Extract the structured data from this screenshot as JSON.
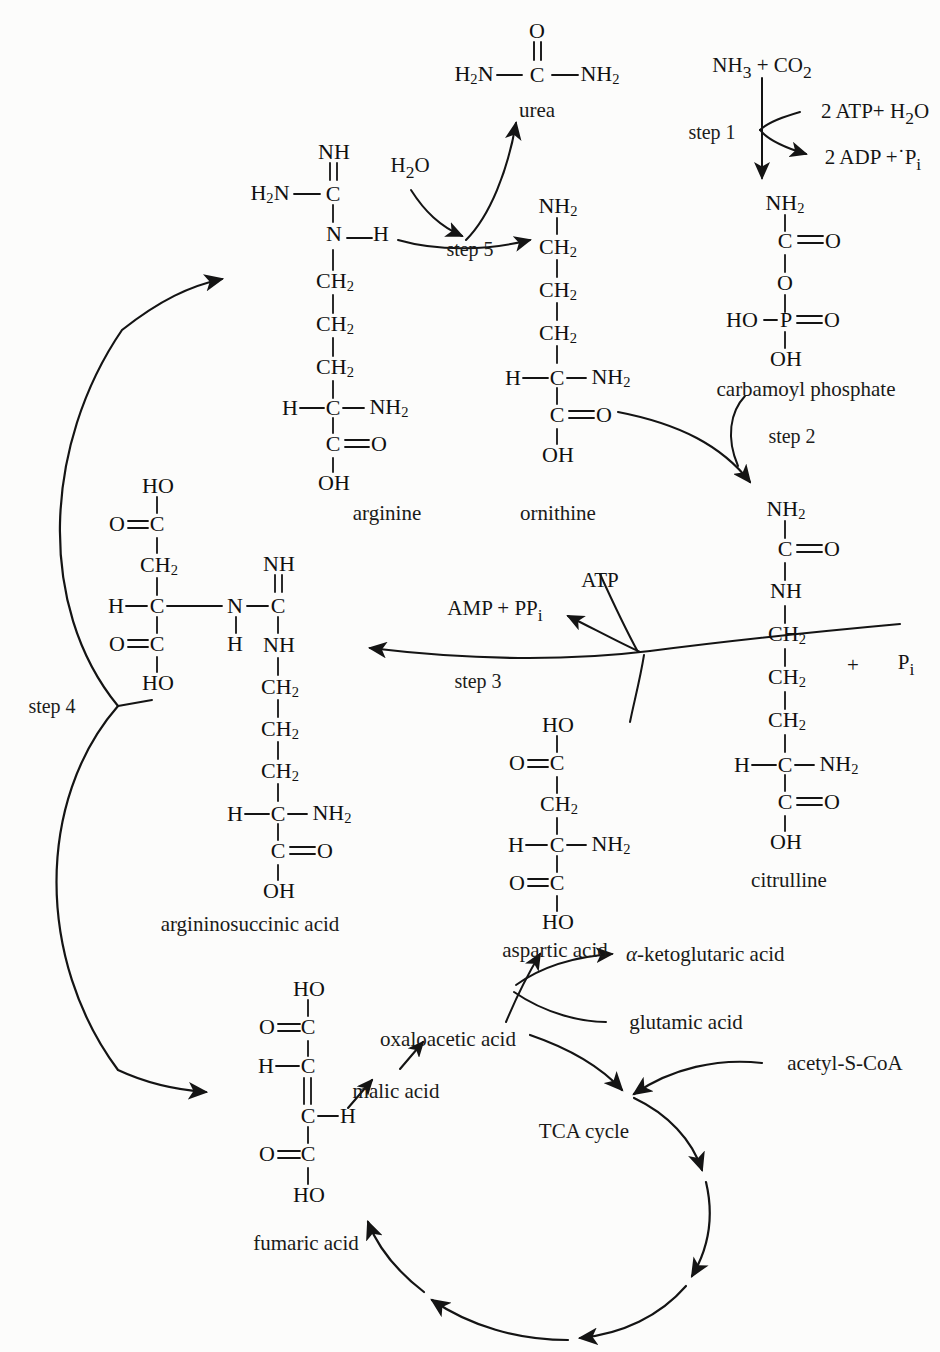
{
  "diagram": {
    "ink_color": "#141414",
    "background_color": "#fcfcfb"
  },
  "molecules": {
    "urea": {
      "name": "urea",
      "atoms": [
        "O",
        "H",
        "N",
        "C",
        "N",
        "H"
      ],
      "left_group": "H",
      "left_sub": "2",
      "left_tail": "N",
      "center": "C",
      "top": "O",
      "right_group": "NH",
      "right_sub": "2"
    },
    "carbamoyl_phosphate": {
      "name": "carbamoyl phosphate",
      "chain": [
        "NH2",
        "C=O",
        "O",
        "HO—P=O",
        "OH"
      ]
    },
    "arginine": {
      "name": "arginine",
      "chain": [
        "NH",
        "H2N—C",
        "N—H",
        "CH2",
        "CH2",
        "CH2",
        "H—C—NH2",
        "C=O",
        "OH"
      ]
    },
    "ornithine": {
      "name": "ornithine",
      "chain": [
        "NH2",
        "CH2",
        "CH2",
        "CH2",
        "H—C—NH2",
        "C=O",
        "OH"
      ]
    },
    "citrulline": {
      "name": "citrulline",
      "chain": [
        "NH2",
        "C=O",
        "NH",
        "CH2",
        "CH2",
        "CH2",
        "H—C—NH2",
        "C=O",
        "OH"
      ]
    },
    "argininosuccinic_acid": {
      "name": "argininosuccinic acid",
      "chain": [
        "HO",
        "O=C",
        "CH2",
        "H—C—N",
        "O=C",
        "HO",
        "H",
        "NH",
        "C",
        "NH",
        "CH2",
        "CH2",
        "CH2",
        "H—C—NH2",
        "C=O",
        "OH"
      ]
    },
    "aspartic_acid": {
      "name": "aspartic acid",
      "chain": [
        "HO",
        "O=C",
        "CH2",
        "H—C—NH2",
        "O=C",
        "HO"
      ]
    },
    "fumaric_acid": {
      "name": "fumaric acid",
      "chain": [
        "HO",
        "O=C",
        "H—C",
        "C—H",
        "O=C",
        "HO"
      ]
    }
  },
  "atom_labels": {
    "urea_H2N": "H",
    "urea_H2N_sub": "2",
    "urea_N": "N",
    "urea_C": "C",
    "urea_O": "O",
    "urea_NH2": "NH",
    "urea_NH2_sub": "2",
    "NH2": "NH",
    "NH": "NH",
    "CH2": "CH",
    "C": "C",
    "N": "N",
    "H": "H",
    "O": "O",
    "OH": "OH",
    "HO": "HO",
    "P": "P"
  },
  "steps": {
    "step1": "step 1",
    "step2": "step 2",
    "step3": "step 3",
    "step4": "step 4",
    "step5": "step 5"
  },
  "cofactors": {
    "substrate_top_right": "NH₃ + CO₂",
    "nh3": "NH",
    "nh3_sub": "3",
    "plus": "+",
    "co2": "CO",
    "co2_sub": "2",
    "atp_in_step1": "2 ATP+ H",
    "atp_in_step1_sub": "2",
    "atp_in_step1_tail": "O",
    "adp_out_step1": "2 ADP +˙P",
    "adp_out_step1_sub": "i",
    "water_step5": "H",
    "water_step5_sub": "2",
    "water_step5_tail": "O",
    "atp_step3": "ATP",
    "amp_pp_step3": "AMP + PP",
    "amp_pp_step3_sub": "i",
    "plus_pi": "+",
    "pi": "P",
    "pi_sub": "i"
  },
  "compound_names": {
    "urea": "urea",
    "carbamoyl_phosphate": "carbamoyl phosphate",
    "arginine": "arginine",
    "ornithine": "ornithine",
    "citrulline": "citrulline",
    "argininosuccinic_acid": "argininosuccinic acid",
    "aspartic_acid": "aspartic acid",
    "fumaric_acid": "fumaric acid",
    "oxaloacetic_acid": "oxaloacetic acid",
    "malic_acid": "malic acid",
    "glutamic_acid": "glutamic acid",
    "ketoglutaric_acid_prefix": "α",
    "ketoglutaric_acid": "-ketoglutaric acid",
    "acetyl_s_coa": "acetyl-S-CoA",
    "tca_cycle": "TCA cycle"
  }
}
